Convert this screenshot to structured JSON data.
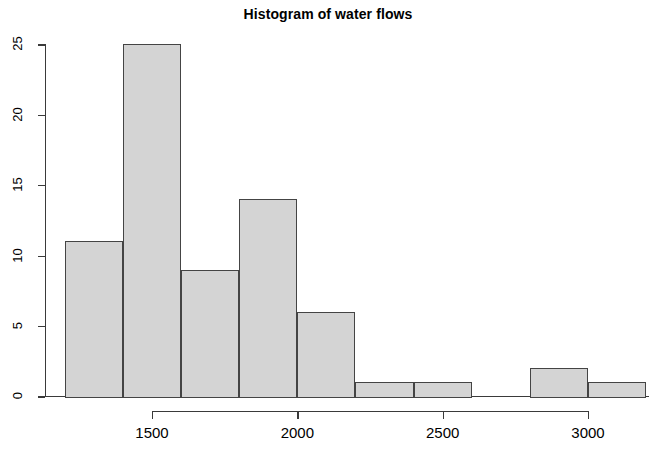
{
  "chart_data": {
    "type": "bar",
    "title": "Histogram of water flows",
    "xlabel": "",
    "ylabel": "",
    "grid": false,
    "legend": null,
    "bin_width": 200,
    "bin_edges": [
      1200,
      1400,
      1600,
      1800,
      2000,
      2200,
      2400,
      2600,
      2800,
      3000,
      3200
    ],
    "categories": [
      "1200-1400",
      "1400-1600",
      "1600-1800",
      "1800-2000",
      "2000-2200",
      "2200-2400",
      "2400-2600",
      "2600-2800",
      "2800-3000",
      "3000-3200"
    ],
    "values": [
      11,
      25,
      9,
      14,
      6,
      1,
      1,
      0,
      2,
      1
    ],
    "xlim": [
      1200,
      3200
    ],
    "ylim": [
      0,
      25
    ],
    "x_ticks": [
      1500,
      2000,
      2500,
      3000
    ],
    "x_tick_labels": [
      "1500",
      "2000",
      "2500",
      "3000"
    ],
    "y_ticks": [
      0,
      5,
      10,
      15,
      20,
      25
    ],
    "y_tick_labels": [
      "0",
      "5",
      "10",
      "15",
      "20",
      "25"
    ],
    "bar_fill_color": "#d4d4d4",
    "bar_border_color": "#444444",
    "axis_color": "#3a3a3a",
    "background_color": "#ffffff"
  }
}
